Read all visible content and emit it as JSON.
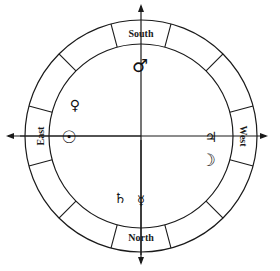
{
  "diagram": {
    "center": [
      141,
      136
    ],
    "outer_radius": 116,
    "inner_radius": 92,
    "divisions": 12,
    "line_color": "#1a1a1a",
    "directions": {
      "top": "South",
      "bottom": "North",
      "left": "East",
      "right": "West"
    },
    "planets": [
      {
        "name": "mars",
        "symbol": "♂",
        "x": 140,
        "y": 66,
        "size": 18
      },
      {
        "name": "venus",
        "symbol": "♀",
        "x": 75,
        "y": 105,
        "size": 14
      },
      {
        "name": "sun",
        "symbol": "☉",
        "x": 69,
        "y": 137,
        "size": 17
      },
      {
        "name": "jupiter",
        "symbol": "♃",
        "x": 211,
        "y": 137,
        "size": 14
      },
      {
        "name": "moon",
        "symbol": "☽",
        "x": 208,
        "y": 160,
        "size": 17
      },
      {
        "name": "saturn",
        "symbol": "♄",
        "x": 120,
        "y": 198,
        "size": 14
      },
      {
        "name": "mercury",
        "symbol": "☿",
        "x": 141,
        "y": 201,
        "size": 13
      }
    ]
  }
}
